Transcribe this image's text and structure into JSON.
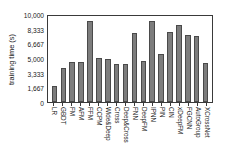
{
  "chart_data": {
    "type": "bar",
    "title": "",
    "subtitle": "",
    "xlabel": "",
    "ylabel": "training time (s)",
    "ylim": [
      0,
      10000
    ],
    "grid": false,
    "legend": null,
    "y_ticks": [
      {
        "value": 0,
        "label": "0"
      },
      {
        "value": 1667,
        "label": "1,667"
      },
      {
        "value": 3333,
        "label": "3,333"
      },
      {
        "value": 5000,
        "label": "5,000"
      },
      {
        "value": 6667,
        "label": "6,667"
      },
      {
        "value": 8333,
        "label": "8,333"
      },
      {
        "value": 10000,
        "label": "10,000"
      }
    ],
    "categories": [
      "LR",
      "GBDT",
      "FM",
      "AFM",
      "FFM",
      "CCPM",
      "Wide&Deep",
      "Cross",
      "Deep&Cross",
      "FNN",
      "DeepFM",
      "IPNN",
      "PIN",
      "CIN",
      "xDeepFM",
      "FGCNN",
      "AutoGroup",
      "XCrossNet"
    ],
    "values": [
      1800,
      3900,
      4600,
      4600,
      9200,
      4950,
      4850,
      4300,
      4300,
      7800,
      4700,
      9200,
      5400,
      7900,
      8700,
      7600,
      7550,
      4450
    ],
    "bar_color": "#7d7d7d",
    "bar_edge_color": "#4a4a4a",
    "axis_color": "#3a3a3a",
    "background_color": "#ffffff"
  }
}
